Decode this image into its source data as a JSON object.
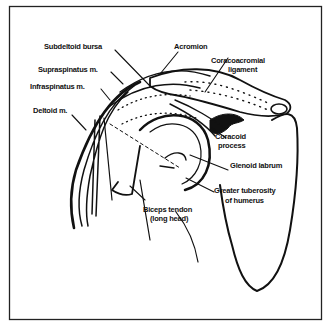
{
  "figure": {
    "labels": {
      "subdeltoid_bursa": "Subdeltoid bursa",
      "acromion": "Acromion",
      "supraspinatus": "Supraspinatus m.",
      "infraspinatus": "Infraspinatus m.",
      "deltoid": "Deltoid m.",
      "coracoacromial_1": "Coracoacromial",
      "coracoacromial_2": "ligament",
      "coracoid_1": "Coracoid",
      "coracoid_2": "process",
      "glenoid": "Glenoid labrum",
      "tuberosity_1": "Greater tuberosity",
      "tuberosity_2": "of humerus",
      "biceps_1": "Biceps tendon",
      "biceps_2": "(long head)"
    },
    "colors": {
      "ink": "#111111",
      "background": "#ffffff"
    }
  }
}
